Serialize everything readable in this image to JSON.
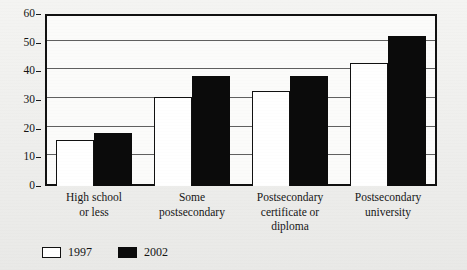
{
  "chart_data": {
    "type": "bar",
    "title": "",
    "xlabel": "",
    "ylabel": "",
    "ylim": [
      0,
      60
    ],
    "y_ticks": [
      0,
      10,
      20,
      30,
      40,
      50,
      60
    ],
    "grid": true,
    "legend_position": "bottom-left",
    "categories": [
      "High school\nor less",
      "Some\npostsecondary",
      "Postsecondary\ncertificate or\ndiploma",
      "Postsecondary\nuniversity"
    ],
    "category_lines": [
      [
        "High school",
        "or less"
      ],
      [
        "Some",
        "postsecondary"
      ],
      [
        "Postsecondary",
        "certificate or",
        "diploma"
      ],
      [
        "Postsecondary",
        "university"
      ]
    ],
    "series": [
      {
        "name": "1997",
        "color": "#ffffff",
        "values": [
          16,
          31,
          33,
          43
        ]
      },
      {
        "name": "2002",
        "color": "#0b0b0b",
        "values": [
          18.5,
          38.5,
          38.5,
          52.5
        ]
      }
    ]
  },
  "legend": {
    "entries": [
      {
        "label": "1997",
        "swatch": "white-square-icon"
      },
      {
        "label": "2002",
        "swatch": "black-square-icon"
      }
    ]
  },
  "axis": {
    "y_tick_labels": [
      "60",
      "50",
      "40",
      "30",
      "20",
      "10",
      "0"
    ]
  },
  "colors": {
    "series_1997": "#ffffff",
    "series_2002": "#0b0b0b",
    "frame": "#111111",
    "gridline": "#3a3a3a",
    "page_background": "#eeeeec"
  }
}
